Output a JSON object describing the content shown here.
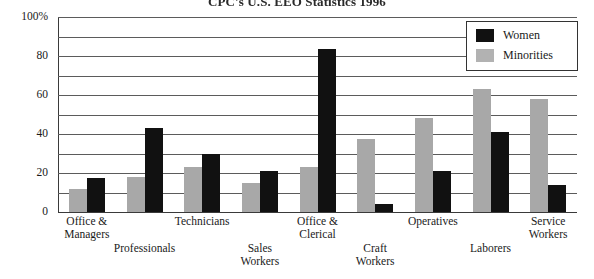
{
  "chart_data": {
    "type": "bar",
    "title": "CPC's U.S. EEO Statistics 1996",
    "xlabel": "",
    "ylabel": "",
    "ylim": [
      0,
      100
    ],
    "ytick_labels": [
      "0",
      "20",
      "40",
      "60",
      "80",
      "100%"
    ],
    "ytick_values": [
      0,
      20,
      40,
      60,
      80,
      100
    ],
    "grid": true,
    "grid_interval": 10,
    "legend_position": "top-right",
    "categories": [
      "Office & Managers",
      "Professionals",
      "Technicians",
      "Sales Workers",
      "Office & Clerical",
      "Craft Workers",
      "Operatives",
      "Laborers",
      "Service Workers"
    ],
    "series": [
      {
        "name": "Women",
        "color": "#111111",
        "values": [
          17.5,
          43,
          30,
          21,
          83.5,
          4,
          21,
          41,
          14
        ]
      },
      {
        "name": "Minorities",
        "color": "#a8a8a8",
        "values": [
          12,
          18,
          23,
          15,
          23,
          37.5,
          48,
          63,
          58
        ]
      }
    ]
  },
  "axis": {
    "y_ticks": [
      {
        "label": "100%",
        "value": 100
      },
      {
        "label": "80",
        "value": 80
      },
      {
        "label": "60",
        "value": 60
      },
      {
        "label": "40",
        "value": 40
      },
      {
        "label": "20",
        "value": 20
      },
      {
        "label": "0",
        "value": 0
      }
    ]
  },
  "legend": {
    "items": [
      {
        "label": "Women",
        "color": "#111111"
      },
      {
        "label": "Minorities",
        "color": "#b2b2b2"
      }
    ]
  },
  "x_labels": [
    {
      "text": "Office &\nManagers",
      "row": "top"
    },
    {
      "text": "Professionals",
      "row": "bottom"
    },
    {
      "text": "Technicians",
      "row": "top"
    },
    {
      "text": "Sales\nWorkers",
      "row": "bottom"
    },
    {
      "text": "Office &\nClerical",
      "row": "top"
    },
    {
      "text": "Craft\nWorkers",
      "row": "bottom"
    },
    {
      "text": "Operatives",
      "row": "top"
    },
    {
      "text": "Laborers",
      "row": "bottom"
    },
    {
      "text": "Service\nWorkers",
      "row": "top"
    }
  ]
}
